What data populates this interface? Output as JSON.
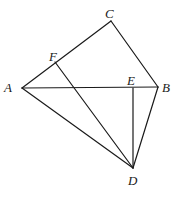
{
  "diagram": {
    "type": "geometry",
    "points": {
      "A": {
        "label": "A",
        "x": 22,
        "y": 88,
        "lx": 4,
        "ly": 81
      },
      "B": {
        "label": "B",
        "x": 158,
        "y": 87,
        "lx": 162,
        "ly": 81
      },
      "C": {
        "label": "C",
        "x": 111,
        "y": 21,
        "lx": 105,
        "ly": 7
      },
      "D": {
        "label": "D",
        "x": 133,
        "y": 168,
        "lx": 128,
        "ly": 174
      },
      "E": {
        "label": "E",
        "x": 133,
        "y": 88,
        "lx": 127,
        "ly": 74
      },
      "F": {
        "label": "F",
        "x": 55,
        "y": 62,
        "lx": 49,
        "ly": 50
      }
    },
    "segments": [
      [
        "A",
        "C"
      ],
      [
        "C",
        "B"
      ],
      [
        "A",
        "B"
      ],
      [
        "A",
        "D"
      ],
      [
        "F",
        "D"
      ],
      [
        "E",
        "D"
      ],
      [
        "B",
        "D"
      ]
    ],
    "stroke_color": "#1a1a1a"
  }
}
